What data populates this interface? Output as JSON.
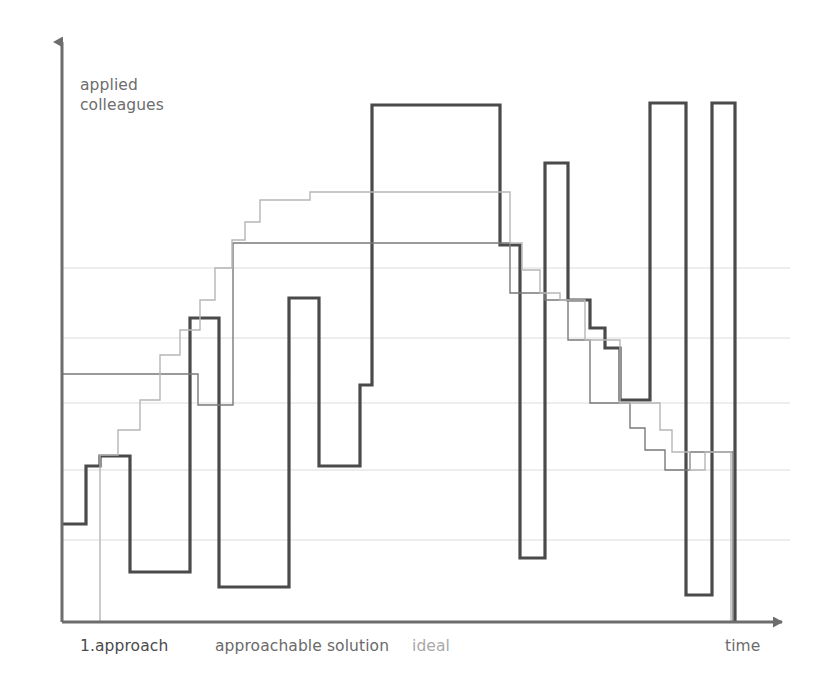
{
  "axes": {
    "y_label": "applied\ncolleagues",
    "x_label": "time",
    "axis_color": "#6d6d6d",
    "grid_color": "#dcdcdc"
  },
  "legend": {
    "approach_label": "1.approach",
    "solution_label": "approachable solution",
    "ideal_label": "ideal"
  },
  "chart_data": {
    "type": "line",
    "title": "",
    "xlabel": "time",
    "ylabel": "applied colleagues",
    "grid": true,
    "gridlines_y": [
      268,
      338,
      403,
      470,
      540
    ],
    "legend_position": "bottom",
    "axis_origin": {
      "x": 62,
      "y": 622
    },
    "plot_extent": {
      "x_min": 62,
      "x_max": 790,
      "y_top": 35,
      "y_bottom": 622
    },
    "series": [
      {
        "name": "1.approach",
        "color": "#4a4a4a",
        "width": 3.2,
        "style": "step",
        "points": [
          [
            62,
            524
          ],
          [
            86,
            524
          ],
          [
            86,
            466
          ],
          [
            100,
            466
          ],
          [
            100,
            456
          ],
          [
            130,
            456
          ],
          [
            130,
            572
          ],
          [
            190,
            572
          ],
          [
            190,
            318
          ],
          [
            219,
            318
          ],
          [
            219,
            587
          ],
          [
            289,
            587
          ],
          [
            289,
            298
          ],
          [
            319,
            298
          ],
          [
            319,
            466
          ],
          [
            360,
            466
          ],
          [
            360,
            385
          ],
          [
            372,
            385
          ],
          [
            372,
            105
          ],
          [
            500,
            105
          ],
          [
            500,
            245
          ],
          [
            520,
            245
          ],
          [
            520,
            558
          ],
          [
            545,
            558
          ],
          [
            545,
            163
          ],
          [
            568,
            163
          ],
          [
            568,
            300
          ],
          [
            590,
            300
          ],
          [
            590,
            328
          ],
          [
            605,
            328
          ],
          [
            605,
            348
          ],
          [
            620,
            348
          ],
          [
            620,
            400
          ],
          [
            650,
            400
          ],
          [
            650,
            103
          ],
          [
            686,
            103
          ],
          [
            686,
            595
          ],
          [
            712,
            595
          ],
          [
            712,
            103
          ],
          [
            735,
            103
          ],
          [
            735,
            622
          ]
        ]
      },
      {
        "name": "approachable solution",
        "color": "#7a7a7a",
        "width": 1.4,
        "style": "step",
        "points": [
          [
            62,
            374
          ],
          [
            198,
            374
          ],
          [
            198,
            405
          ],
          [
            233,
            405
          ],
          [
            233,
            243
          ],
          [
            510,
            243
          ],
          [
            510,
            293
          ],
          [
            545,
            293
          ],
          [
            545,
            300
          ],
          [
            568,
            300
          ],
          [
            568,
            340
          ],
          [
            590,
            340
          ],
          [
            590,
            403
          ],
          [
            630,
            403
          ],
          [
            630,
            428
          ],
          [
            645,
            428
          ],
          [
            645,
            450
          ],
          [
            665,
            450
          ],
          [
            665,
            470
          ],
          [
            690,
            470
          ],
          [
            690,
            452
          ],
          [
            733,
            452
          ],
          [
            733,
            622
          ]
        ]
      },
      {
        "name": "ideal",
        "color": "#b6b6b6",
        "width": 1.4,
        "style": "step",
        "points": [
          [
            62,
            622
          ],
          [
            100,
            622
          ],
          [
            100,
            455
          ],
          [
            118,
            455
          ],
          [
            118,
            430
          ],
          [
            140,
            430
          ],
          [
            140,
            400
          ],
          [
            160,
            400
          ],
          [
            160,
            355
          ],
          [
            180,
            355
          ],
          [
            180,
            330
          ],
          [
            200,
            330
          ],
          [
            200,
            300
          ],
          [
            215,
            300
          ],
          [
            215,
            268
          ],
          [
            232,
            268
          ],
          [
            232,
            240
          ],
          [
            245,
            240
          ],
          [
            245,
            222
          ],
          [
            260,
            222
          ],
          [
            260,
            200
          ],
          [
            310,
            200
          ],
          [
            310,
            192
          ],
          [
            510,
            192
          ],
          [
            510,
            243
          ],
          [
            522,
            243
          ],
          [
            522,
            270
          ],
          [
            540,
            270
          ],
          [
            540,
            293
          ],
          [
            560,
            293
          ],
          [
            560,
            300
          ],
          [
            585,
            300
          ],
          [
            585,
            340
          ],
          [
            620,
            340
          ],
          [
            620,
            403
          ],
          [
            660,
            403
          ],
          [
            660,
            430
          ],
          [
            672,
            430
          ],
          [
            672,
            452
          ],
          [
            690,
            452
          ],
          [
            690,
            470
          ],
          [
            705,
            470
          ],
          [
            705,
            452
          ],
          [
            731,
            452
          ],
          [
            731,
            622
          ]
        ]
      }
    ]
  }
}
